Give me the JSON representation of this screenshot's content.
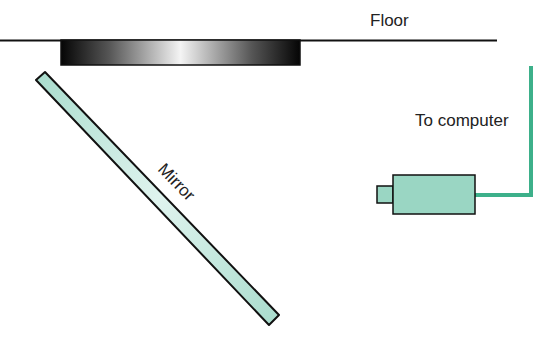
{
  "diagram": {
    "labels": {
      "floor": "Floor",
      "computer": "To computer",
      "mirror": "Mirror"
    },
    "colors": {
      "mirror_fill": "#b9e3d8",
      "camera_fill": "#9ad6c3",
      "cable": "#3db08a",
      "outline": "#111111"
    }
  }
}
